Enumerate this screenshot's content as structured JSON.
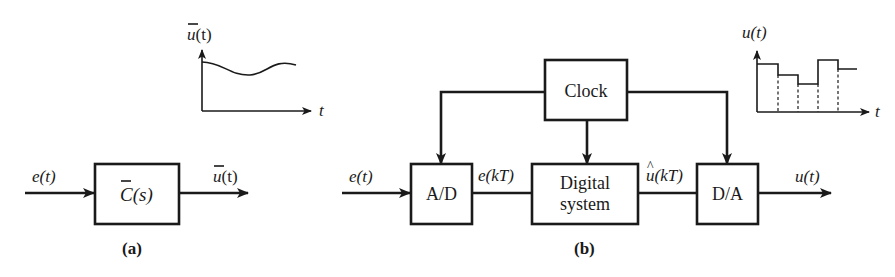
{
  "panel_a": {
    "caption": "(a)",
    "input_label_main": "e",
    "input_label_arg": "(t)",
    "block_label_main": "C",
    "block_label_arg": "(s)",
    "output_label_main": "u",
    "output_label_arg": "(t)",
    "graph": {
      "y_label_main": "u",
      "y_label_arg": "(t)",
      "x_label": "t",
      "curve": "smooth continuous signal"
    }
  },
  "panel_b": {
    "caption": "(b)",
    "input_label_main": "e",
    "input_label_arg": "(t)",
    "ad_label": "A/D",
    "sampled_label_main": "e",
    "sampled_label_arg": "(kT)",
    "digital_label_line1": "Digital",
    "digital_label_line2": "system",
    "clock_label": "Clock",
    "digital_out_label_main": "u",
    "digital_out_hat": "^",
    "digital_out_label_arg": "(kT)",
    "da_label": "D/A",
    "output_label_main": "u",
    "output_label_arg": "(t)",
    "graph": {
      "y_label_main": "u",
      "y_label_arg": "(t)",
      "x_label": "t",
      "step_levels": [
        64,
        75,
        84,
        60,
        69
      ]
    }
  }
}
